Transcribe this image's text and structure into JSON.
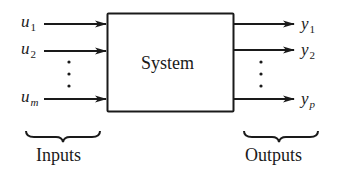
{
  "diagram": {
    "system_block": {
      "label": "System"
    },
    "inputs": [
      {
        "var": "u",
        "sub": "1"
      },
      {
        "var": "u",
        "sub": "2"
      },
      {
        "var": "u",
        "sub": "m"
      }
    ],
    "outputs": [
      {
        "var": "y",
        "sub": "1"
      },
      {
        "var": "y",
        "sub": "2"
      },
      {
        "var": "y",
        "sub": "p"
      }
    ],
    "inputs_group_label": "Inputs",
    "outputs_group_label": "Outputs",
    "ellipsis": "vertical-dots"
  }
}
